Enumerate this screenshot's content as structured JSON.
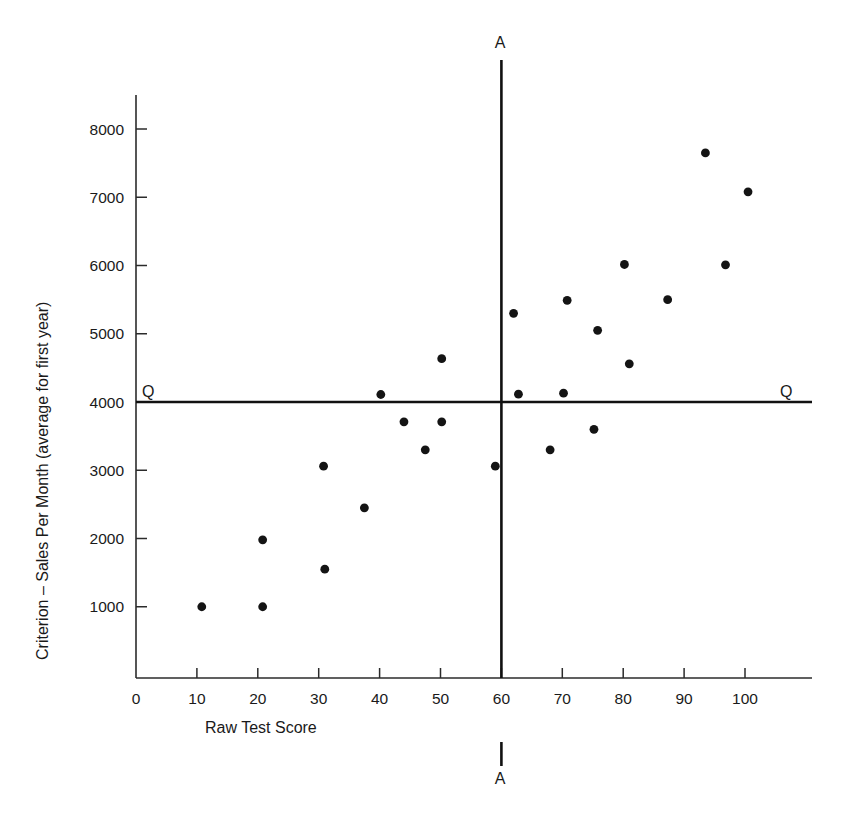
{
  "chart_data": {
    "type": "scatter",
    "title": "",
    "xlabel": "Raw Test Score",
    "ylabel": "Criterion – Sales Per Month  (average for first year)",
    "xlim": [
      0,
      108
    ],
    "ylim": [
      0,
      8600
    ],
    "xticks": [
      0,
      10,
      20,
      30,
      40,
      50,
      60,
      70,
      80,
      90,
      100
    ],
    "yticks": [
      1000,
      2000,
      3000,
      4000,
      5000,
      6000,
      7000,
      8000
    ],
    "xtick_labels": [
      "0",
      "10",
      "20",
      "30",
      "40",
      "50",
      "60",
      "70",
      "80",
      "90",
      "100"
    ],
    "ytick_labels": [
      "1000",
      "2000",
      "3000",
      "4000",
      "5000",
      "6000",
      "7000",
      "8000"
    ],
    "grid": false,
    "legend": null,
    "points": [
      {
        "x": 10.8,
        "y": 1000
      },
      {
        "x": 20.8,
        "y": 1000
      },
      {
        "x": 20.8,
        "y": 1980
      },
      {
        "x": 31.0,
        "y": 1550
      },
      {
        "x": 30.8,
        "y": 3060
      },
      {
        "x": 37.5,
        "y": 2450
      },
      {
        "x": 40.2,
        "y": 4110
      },
      {
        "x": 44.0,
        "y": 3710
      },
      {
        "x": 47.5,
        "y": 3300
      },
      {
        "x": 50.2,
        "y": 3710
      },
      {
        "x": 50.2,
        "y": 4635
      },
      {
        "x": 59.0,
        "y": 3060
      },
      {
        "x": 62.0,
        "y": 5300
      },
      {
        "x": 62.8,
        "y": 4115
      },
      {
        "x": 68.0,
        "y": 3300
      },
      {
        "x": 70.2,
        "y": 4130
      },
      {
        "x": 70.8,
        "y": 5490
      },
      {
        "x": 75.2,
        "y": 3600
      },
      {
        "x": 75.8,
        "y": 5050
      },
      {
        "x": 80.2,
        "y": 6015
      },
      {
        "x": 81.0,
        "y": 4560
      },
      {
        "x": 87.3,
        "y": 5500
      },
      {
        "x": 93.5,
        "y": 7650
      },
      {
        "x": 96.8,
        "y": 6010
      },
      {
        "x": 100.5,
        "y": 7080
      }
    ],
    "reference_lines": [
      {
        "id": "criterion-cutoff",
        "orientation": "horizontal",
        "value": 4000,
        "label": "Q",
        "label_positions": [
          "left",
          "right"
        ]
      },
      {
        "id": "test-cutoff",
        "orientation": "vertical",
        "value": 60,
        "label": "A",
        "label_positions": [
          "top",
          "bottom"
        ]
      }
    ],
    "annotations": {
      "top_label": "A",
      "bottom_label": "A",
      "left_label": "Q",
      "right_label": "Q"
    },
    "colors": {
      "point": "#141414",
      "axis": "#2b2b2b",
      "cutline": "#111111",
      "background": "#ffffff"
    }
  }
}
